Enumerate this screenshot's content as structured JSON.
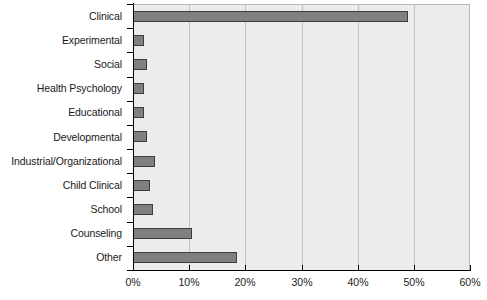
{
  "chart_data": {
    "type": "bar",
    "orientation": "horizontal",
    "title": "",
    "xlabel": "",
    "ylabel": "",
    "categories": [
      "Clinical",
      "Experimental",
      "Social",
      "Health Psychology",
      "Educational",
      "Developmental",
      "Industrial/Organizational",
      "Child Clinical",
      "School",
      "Counseling",
      "Other"
    ],
    "values": [
      49,
      2,
      2.5,
      2,
      2,
      2.5,
      4,
      3,
      3.5,
      10.5,
      18.5
    ],
    "xlim": [
      0,
      60
    ],
    "xticks": [
      0,
      10,
      20,
      30,
      40,
      50,
      60
    ],
    "xticklabels": [
      "0%",
      "10%",
      "20%",
      "30%",
      "40%",
      "50%",
      "60%"
    ],
    "grid": "vertical",
    "legend": "none",
    "bar_color": "#808080",
    "bar_edge_color": "#3d3d3d",
    "plot_background": "#ececec",
    "figure_background": "#ffffff",
    "gridline_color": "#c2c2c2",
    "axis_color": "#000000"
  }
}
